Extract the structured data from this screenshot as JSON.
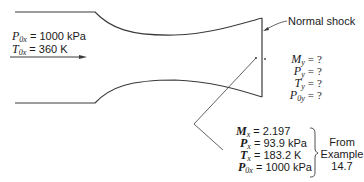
{
  "diagram": {
    "inlet_conditions": [
      {
        "symbol": "P",
        "subscript": "0x",
        "equals": "=",
        "value": "1000 kPa"
      },
      {
        "symbol": "T",
        "subscript": "0x",
        "equals": "=",
        "value": "360 K"
      }
    ],
    "shock_label": "Normal shock",
    "unknowns": [
      {
        "symbol": "M",
        "subscript": "y",
        "equals": "=",
        "value": "?"
      },
      {
        "symbol": "P",
        "subscript": "y",
        "equals": "=",
        "value": "?"
      },
      {
        "symbol": "T",
        "subscript": "y",
        "equals": "=",
        "value": "?"
      },
      {
        "symbol": "P",
        "subscript": "0y",
        "equals": "=",
        "value": "?"
      }
    ],
    "known_upstream": [
      {
        "symbol": "M",
        "subscript": "x",
        "equals": "=",
        "value": "2.197"
      },
      {
        "symbol": "P",
        "subscript": "x",
        "equals": "=",
        "value": "93.9 kPa"
      },
      {
        "symbol": "T",
        "subscript": "x",
        "equals": "=",
        "value": "183.2 K"
      },
      {
        "symbol": "P",
        "subscript": "0x",
        "equals": "=",
        "value": "1000 kPa"
      }
    ],
    "source_note": {
      "line1": "From",
      "line2": "Example",
      "line3": "14.7"
    },
    "colors": {
      "line": "#3a3a3a",
      "text": "#1a1a1a",
      "background": "#ffffff"
    }
  }
}
